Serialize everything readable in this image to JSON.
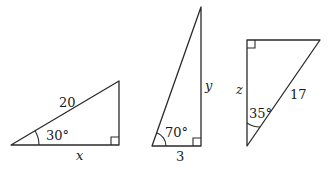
{
  "figure": {
    "triangles": [
      {
        "id": "triangle-1",
        "hypotenuse_label": "20",
        "angle_label": "30°",
        "base_label": "x",
        "right_angle": "bottom-right"
      },
      {
        "id": "triangle-2",
        "side_label": "y",
        "angle_label": "70°",
        "base_label": "3",
        "right_angle": "bottom-right"
      },
      {
        "id": "triangle-3",
        "side_label": "z",
        "hypotenuse_label": "17",
        "angle_label": "35°",
        "right_angle": "top-left"
      }
    ]
  }
}
